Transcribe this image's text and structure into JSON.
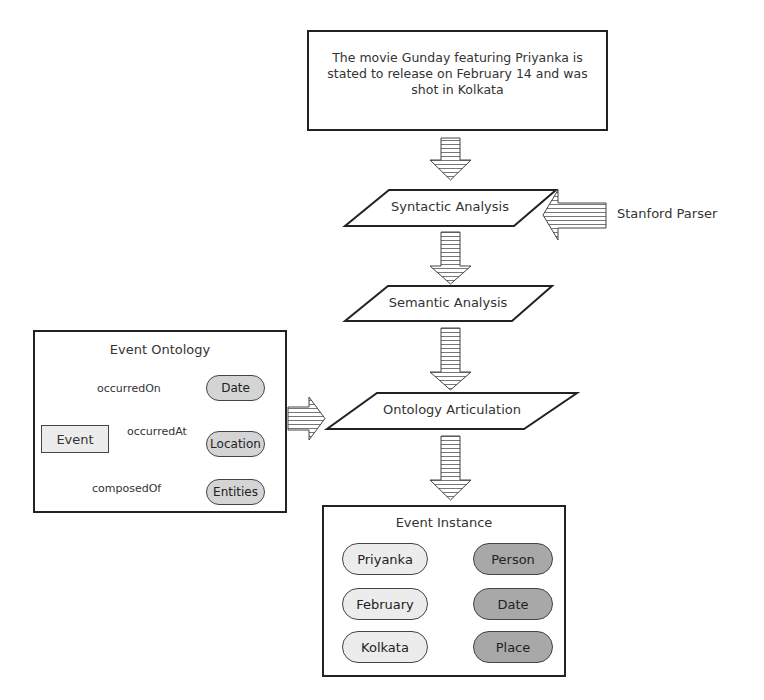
{
  "input_sentence": {
    "lines": [
      "The movie Gunday featuring Priyanka is",
      "stated to release on February 14 and was",
      "shot in Kolkata"
    ]
  },
  "pipeline": {
    "steps": [
      {
        "label": "Syntactic Analysis"
      },
      {
        "label": "Semantic Analysis"
      },
      {
        "label": "Ontology Articulation"
      }
    ],
    "external_tool": "Stanford Parser"
  },
  "event_ontology": {
    "title": "Event Ontology",
    "root": "Event",
    "relations": [
      {
        "name": "occurredOn",
        "target": "Date"
      },
      {
        "name": "occurredAt",
        "target": "Location"
      },
      {
        "name": "composedOf",
        "target": "Entities"
      }
    ]
  },
  "event_instance": {
    "title": "Event Instance",
    "mappings": [
      {
        "value": "Priyanka",
        "type": "Person"
      },
      {
        "value": "February",
        "type": "Date"
      },
      {
        "value": "Kolkata",
        "type": "Place"
      }
    ]
  },
  "colors": {
    "stroke": "#222222",
    "arrow_hatch": "#777777",
    "pill_light": "#ececec",
    "pill_dark": "#a8a8a8",
    "pill_ontology": "#d4d4d4"
  }
}
